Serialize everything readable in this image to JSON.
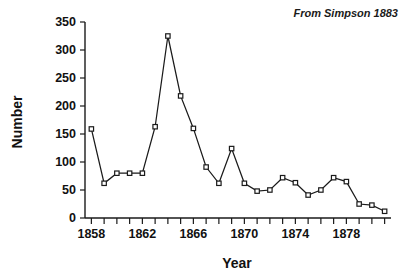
{
  "chart_data": {
    "type": "line",
    "title": "",
    "subtitle": "",
    "xlabel": "Year",
    "ylabel": "Number",
    "annotation": "From Simpson 1883",
    "annotation_position": "top-right",
    "grid": false,
    "legend": null,
    "marker_style": "open-square",
    "line_color": "#1a1a1a",
    "marker_fill": "#ffffff",
    "xlim": [
      1857.5,
      1881.5
    ],
    "ylim": [
      0,
      350
    ],
    "x_tick_labels": [
      "1858",
      "1862",
      "1866",
      "1870",
      "1874",
      "1878"
    ],
    "x_major_ticks": [
      1858,
      1862,
      1866,
      1870,
      1874,
      1878
    ],
    "x_minor_ticks": [
      1859,
      1860,
      1861,
      1863,
      1864,
      1865,
      1867,
      1868,
      1869,
      1871,
      1872,
      1873,
      1875,
      1876,
      1877,
      1879,
      1880,
      1881
    ],
    "y_tick_labels": [
      "0",
      "50",
      "100",
      "150",
      "200",
      "250",
      "300",
      "350"
    ],
    "y_ticks": [
      0,
      50,
      100,
      150,
      200,
      250,
      300,
      350
    ],
    "x": [
      1858,
      1859,
      1860,
      1861,
      1862,
      1863,
      1864,
      1865,
      1866,
      1867,
      1868,
      1869,
      1870,
      1871,
      1872,
      1873,
      1874,
      1875,
      1876,
      1877,
      1878,
      1879,
      1880,
      1881
    ],
    "values": [
      159,
      62,
      80,
      80,
      80,
      163,
      325,
      218,
      160,
      91,
      62,
      124,
      62,
      48,
      50,
      72,
      63,
      41,
      50,
      72,
      65,
      25,
      23,
      12
    ],
    "categories": [
      "1858",
      "1859",
      "1860",
      "1861",
      "1862",
      "1863",
      "1864",
      "1865",
      "1866",
      "1867",
      "1868",
      "1869",
      "1870",
      "1871",
      "1872",
      "1873",
      "1874",
      "1875",
      "1876",
      "1877",
      "1878",
      "1879",
      "1880",
      "1881"
    ]
  }
}
